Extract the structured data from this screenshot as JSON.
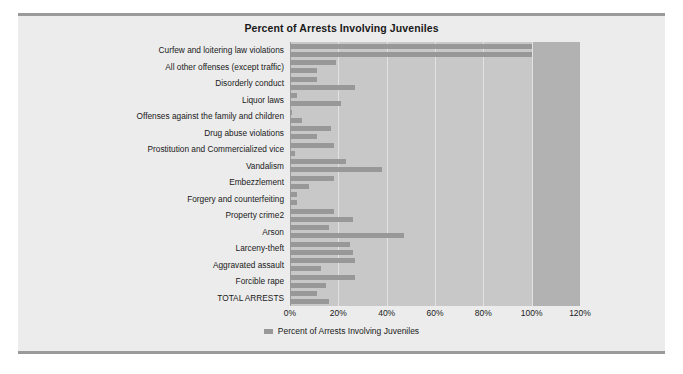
{
  "chart_title": "Percent of Arrests Involving Juveniles",
  "legend": {
    "entries": [
      {
        "label": "Percent of Arrests Involving Juveniles",
        "color": "#989898"
      }
    ]
  },
  "colors": {
    "bar": "#989898",
    "plot_background": "#c8c8c8",
    "over_100_band": "#b2b2b2",
    "gridline": "#e2e2e2",
    "card_background": "#ececec",
    "page_background": "#ffffff",
    "rule": "#9a9a9a",
    "text": "#1a1a1a"
  },
  "chart_data": {
    "type": "bar",
    "orientation": "horizontal",
    "title": "Percent of Arrests Involving Juveniles",
    "xlabel": "",
    "ylabel": "",
    "xlim": [
      0,
      120
    ],
    "xticks": [
      0,
      20,
      40,
      60,
      80,
      100,
      120
    ],
    "xticklabels": [
      "0%",
      "20%",
      "40%",
      "60%",
      "80%",
      "100%",
      "120%"
    ],
    "grid": true,
    "legend_position": "bottom",
    "series": [
      {
        "name": "Percent of Arrests Involving Juveniles",
        "color": "#989898",
        "values": [
          100,
          100,
          19,
          11,
          11,
          27,
          3,
          21,
          1,
          5,
          17,
          11,
          18,
          2,
          23,
          38,
          18,
          8,
          3,
          3,
          18,
          26,
          16,
          47,
          25,
          26,
          27,
          13,
          27,
          15,
          11,
          16
        ]
      }
    ],
    "visible_category_labels": [
      "Curfew and loitering law violations",
      "All other offenses (except traffic)",
      "Disorderly conduct",
      "Liquor laws",
      "Offenses against the family and children",
      "Drug abuse violations",
      "Prostitution and Commercialized vice",
      "Vandalism",
      "Embezzlement",
      "Forgery and counterfeiting",
      "Property crime2",
      "Arson",
      "Larceny-theft",
      "Aggravated assault",
      "Forcible rape",
      "TOTAL ARRESTS"
    ],
    "note": "Category axis shows every other tick label; 32 bars are plotted against 16 displayed labels."
  }
}
